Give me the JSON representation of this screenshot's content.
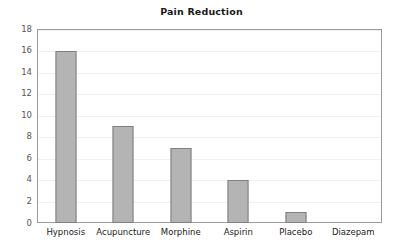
{
  "chart_data": {
    "type": "bar",
    "title": "Pain Reduction",
    "xlabel": "",
    "ylabel": "",
    "categories": [
      "Hypnosis",
      "Acupuncture",
      "Morphine",
      "Aspirin",
      "Placebo",
      "Diazepam"
    ],
    "values": [
      16,
      9,
      7,
      4,
      1,
      0
    ],
    "ylim": [
      0,
      18
    ],
    "ytick_step": 2,
    "yticks": [
      "18",
      "16",
      "14",
      "12",
      "10",
      "8",
      "6",
      "4",
      "2",
      "0"
    ],
    "ytick_values": [
      18,
      16,
      14,
      12,
      10,
      8,
      6,
      4,
      2,
      0
    ],
    "grid": true,
    "grid_axis": "y",
    "legend": false,
    "legend_position": "none",
    "bar_fill_color": "#b4b4b4",
    "bar_border_color": "#808080",
    "gridline_color": "#f0f0f0",
    "frame_color": "#9a9a9a",
    "background_color": "#ffffff",
    "title_color": "#1a1a1a",
    "ytick_label_color": "#555555",
    "xtick_label_color": "#222222"
  }
}
